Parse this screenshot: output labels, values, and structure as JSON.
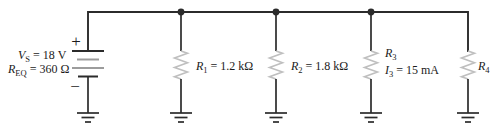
{
  "colors": {
    "background": "#ffffff",
    "wire": "#2b2b2b",
    "plate_gray": "#9c9c9c",
    "resistor": "#bfbfbf",
    "text": "#1b1b1b"
  },
  "source": {
    "plus": "+",
    "minus": "−",
    "voltage_var": "V",
    "voltage_sub": "S",
    "voltage_eq": " = 18 V",
    "req_var": "R",
    "req_sub": "EQ",
    "req_eq": " = 360 Ω"
  },
  "resistors": [
    {
      "id": "R1",
      "var": "R",
      "sub": "1",
      "eq": " = 1.2 kΩ"
    },
    {
      "id": "R2",
      "var": "R",
      "sub": "2",
      "eq": " = 1.8 kΩ"
    },
    {
      "id": "R3",
      "var": "R",
      "sub": "3",
      "eq": "",
      "current_var": "I",
      "current_sub": "3",
      "current_eq": " = 15 mA"
    },
    {
      "id": "R4",
      "var": "R",
      "sub": "4",
      "eq": ""
    }
  ]
}
